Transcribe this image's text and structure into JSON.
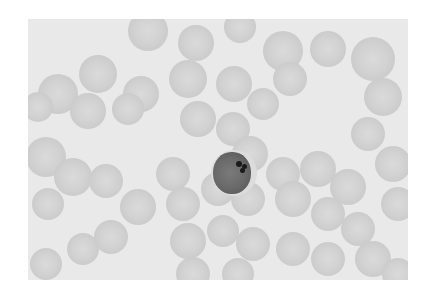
{
  "image": {
    "description": "Grayscale photomicrograph of a peripheral blood smear showing many red blood cells and one central darker-stained nucleated cell with a small dark inclusion",
    "background_color": "#e9e9e9",
    "page_color": "#ffffff",
    "rbc_color": "#d0d0d0",
    "nucleus_color": "#6a6a6a",
    "inclusion_color": "#1a1a1a"
  },
  "cells": [
    {
      "x": 120,
      "y": 12,
      "r": 20
    },
    {
      "x": 168,
      "y": 24,
      "r": 18
    },
    {
      "x": 212,
      "y": 8,
      "r": 16
    },
    {
      "x": 255,
      "y": 32,
      "r": 20
    },
    {
      "x": 300,
      "y": 30,
      "r": 18
    },
    {
      "x": 345,
      "y": 40,
      "r": 22
    },
    {
      "x": 70,
      "y": 55,
      "r": 19
    },
    {
      "x": 113,
      "y": 75,
      "r": 18
    },
    {
      "x": 160,
      "y": 60,
      "r": 19
    },
    {
      "x": 206,
      "y": 65,
      "r": 18
    },
    {
      "x": 262,
      "y": 60,
      "r": 17
    },
    {
      "x": 30,
      "y": 75,
      "r": 20
    },
    {
      "x": 10,
      "y": 88,
      "r": 15
    },
    {
      "x": 60,
      "y": 92,
      "r": 18
    },
    {
      "x": 100,
      "y": 90,
      "r": 16
    },
    {
      "x": 170,
      "y": 100,
      "r": 18
    },
    {
      "x": 205,
      "y": 110,
      "r": 17
    },
    {
      "x": 235,
      "y": 85,
      "r": 16
    },
    {
      "x": 355,
      "y": 78,
      "r": 19
    },
    {
      "x": 340,
      "y": 115,
      "r": 17
    },
    {
      "x": 365,
      "y": 145,
      "r": 18
    },
    {
      "x": 18,
      "y": 138,
      "r": 20
    },
    {
      "x": 45,
      "y": 158,
      "r": 19
    },
    {
      "x": 78,
      "y": 162,
      "r": 17
    },
    {
      "x": 20,
      "y": 185,
      "r": 16
    },
    {
      "x": 145,
      "y": 155,
      "r": 17
    },
    {
      "x": 222,
      "y": 135,
      "r": 18
    },
    {
      "x": 255,
      "y": 155,
      "r": 17
    },
    {
      "x": 290,
      "y": 150,
      "r": 18
    },
    {
      "x": 320,
      "y": 168,
      "r": 18
    },
    {
      "x": 370,
      "y": 185,
      "r": 17
    },
    {
      "x": 110,
      "y": 188,
      "r": 18
    },
    {
      "x": 155,
      "y": 185,
      "r": 17
    },
    {
      "x": 190,
      "y": 170,
      "r": 17
    },
    {
      "x": 220,
      "y": 180,
      "r": 17
    },
    {
      "x": 265,
      "y": 180,
      "r": 18
    },
    {
      "x": 300,
      "y": 195,
      "r": 17
    },
    {
      "x": 330,
      "y": 210,
      "r": 17
    },
    {
      "x": 55,
      "y": 230,
      "r": 16
    },
    {
      "x": 83,
      "y": 218,
      "r": 17
    },
    {
      "x": 160,
      "y": 222,
      "r": 18
    },
    {
      "x": 195,
      "y": 212,
      "r": 16
    },
    {
      "x": 225,
      "y": 225,
      "r": 17
    },
    {
      "x": 265,
      "y": 230,
      "r": 17
    },
    {
      "x": 300,
      "y": 240,
      "r": 17
    },
    {
      "x": 345,
      "y": 240,
      "r": 18
    },
    {
      "x": 18,
      "y": 245,
      "r": 16
    },
    {
      "x": 165,
      "y": 255,
      "r": 17
    },
    {
      "x": 210,
      "y": 255,
      "r": 16
    },
    {
      "x": 370,
      "y": 255,
      "r": 16
    }
  ],
  "target_cell": {
    "outer": {
      "x": 183,
      "y": 131,
      "w": 46,
      "h": 46
    },
    "nucleus": {
      "x": 185,
      "y": 133,
      "w": 38,
      "h": 42
    },
    "inclusions": [
      {
        "x": 211,
        "y": 145,
        "r": 3
      },
      {
        "x": 216,
        "y": 147,
        "r": 2.5
      },
      {
        "x": 214,
        "y": 151,
        "r": 2.5
      }
    ]
  }
}
